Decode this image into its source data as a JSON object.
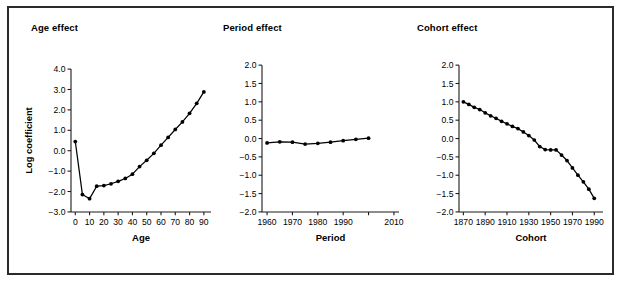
{
  "figure": {
    "border_color": "#2b2b2b",
    "background": "#ffffff",
    "series_color": "#000000"
  },
  "panels": {
    "age": {
      "title": "Age effect",
      "xlabel": "Age",
      "ylabel": "Log coefficient"
    },
    "period": {
      "title": "Period effect",
      "xlabel": "Period",
      "ylabel": ""
    },
    "cohort": {
      "title": "Cohort effect",
      "xlabel": "Cohort",
      "ylabel": ""
    }
  },
  "chart_data": [
    {
      "type": "line",
      "title": "Age effect",
      "xlabel": "Age",
      "ylabel": "Log coefficient",
      "xlim": [
        -3,
        95
      ],
      "ylim": [
        -3.0,
        4.0
      ],
      "xticks": [
        0,
        10,
        20,
        30,
        40,
        50,
        60,
        70,
        80,
        90
      ],
      "xticklabels": [
        "0",
        "10",
        "20",
        "30",
        "40",
        "50",
        "60",
        "70",
        "80",
        "90"
      ],
      "yticks": [
        -3.0,
        -2.0,
        -1.0,
        0.0,
        1.0,
        2.0,
        3.0,
        4.0
      ],
      "yticklabels": [
        "−3.0",
        "−2.0",
        "−1.0",
        "0.0",
        "1.0",
        "2.0",
        "3.0",
        "4.0"
      ],
      "grid": false,
      "legend": null,
      "markers": true,
      "x": [
        0,
        5,
        10,
        15,
        20,
        25,
        30,
        35,
        40,
        45,
        50,
        55,
        60,
        65,
        70,
        75,
        80,
        85,
        90
      ],
      "values": [
        0.45,
        -2.15,
        -2.35,
        -1.74,
        -1.71,
        -1.62,
        -1.5,
        -1.36,
        -1.15,
        -0.78,
        -0.47,
        -0.13,
        0.27,
        0.65,
        1.04,
        1.41,
        1.83,
        2.32,
        2.88
      ]
    },
    {
      "type": "line",
      "title": "Period effect",
      "xlabel": "Period",
      "ylabel": "",
      "xlim": [
        1958,
        2012
      ],
      "ylim": [
        -2.0,
        2.0
      ],
      "xticks": [
        1960,
        1970,
        1980,
        1990,
        2000,
        2010
      ],
      "xticklabels": [
        "1960",
        "1970",
        "1980",
        "1990",
        "",
        "2010"
      ],
      "yticks": [
        -2.0,
        -1.5,
        -1.0,
        -0.5,
        0.0,
        0.5,
        1.0,
        1.5,
        2.0
      ],
      "yticklabels": [
        "−2.0",
        "−1.5",
        "−1.0",
        "−0.5",
        "0.0",
        "0.5",
        "1.0",
        "1.5",
        "2.0"
      ],
      "grid": false,
      "legend": null,
      "markers": true,
      "x": [
        1960,
        1965,
        1970,
        1975,
        1980,
        1985,
        1990,
        1995,
        2000
      ],
      "values": [
        -0.12,
        -0.09,
        -0.1,
        -0.15,
        -0.13,
        -0.1,
        -0.06,
        -0.02,
        0.01
      ]
    },
    {
      "type": "line",
      "title": "Cohort effect",
      "xlabel": "Cohort",
      "ylabel": "",
      "xlim": [
        1866,
        1998
      ],
      "ylim": [
        -2.0,
        2.0
      ],
      "xticks": [
        1870,
        1890,
        1910,
        1930,
        1950,
        1970,
        1990
      ],
      "xticklabels": [
        "1870",
        "1890",
        "1910",
        "1930",
        "1950",
        "1970",
        "1990"
      ],
      "yticks": [
        -2.0,
        -1.5,
        -1.0,
        -0.5,
        0.0,
        0.5,
        1.0,
        1.5,
        2.0
      ],
      "yticklabels": [
        "−2.0",
        "−1.5",
        "−1.0",
        "−0.5",
        "0.0",
        "0.5",
        "1.0",
        "1.5",
        "2.0"
      ],
      "grid": false,
      "legend": null,
      "markers": true,
      "x": [
        1870,
        1875,
        1880,
        1885,
        1890,
        1895,
        1900,
        1905,
        1910,
        1915,
        1920,
        1925,
        1930,
        1935,
        1940,
        1945,
        1950,
        1955,
        1960,
        1965,
        1970,
        1975,
        1980,
        1985,
        1990
      ],
      "values": [
        1.0,
        0.93,
        0.85,
        0.79,
        0.7,
        0.62,
        0.55,
        0.47,
        0.4,
        0.33,
        0.27,
        0.18,
        0.08,
        -0.04,
        -0.22,
        -0.3,
        -0.31,
        -0.31,
        -0.45,
        -0.6,
        -0.8,
        -1.0,
        -1.18,
        -1.38,
        -1.63
      ]
    }
  ]
}
